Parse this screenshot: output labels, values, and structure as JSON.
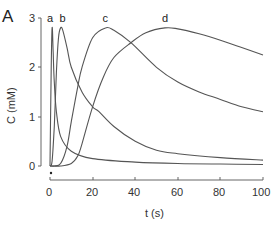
{
  "panel_label": "A",
  "chart_data": {
    "type": "line",
    "title": "",
    "xlabel": "t (s)",
    "ylabel": "C (mM)",
    "xlim": [
      0,
      100
    ],
    "ylim": [
      0,
      3
    ],
    "xticks": [
      0,
      20,
      40,
      60,
      80,
      100
    ],
    "yticks": [
      0,
      1,
      2,
      3
    ],
    "grid": false,
    "legend": "inline curve labels at peaks",
    "series": [
      {
        "name": "a",
        "x": [
          0,
          0.5,
          1,
          1.5,
          2,
          3,
          5,
          10,
          20,
          40,
          60,
          80,
          100
        ],
        "values": [
          0,
          1.8,
          2.8,
          2.3,
          1.7,
          1.1,
          0.6,
          0.3,
          0.15,
          0.08,
          0.05,
          0.04,
          0.03
        ]
      },
      {
        "name": "b",
        "x": [
          0,
          1,
          2,
          3,
          4,
          5,
          6,
          8,
          10,
          15,
          20,
          23,
          30,
          40,
          50,
          60,
          80,
          100
        ],
        "values": [
          0,
          0.1,
          0.8,
          1.9,
          2.6,
          2.8,
          2.75,
          2.4,
          2.0,
          1.5,
          1.2,
          1.1,
          0.8,
          0.5,
          0.32,
          0.25,
          0.17,
          0.12
        ]
      },
      {
        "name": "c",
        "x": [
          0,
          2,
          5,
          8,
          10,
          13,
          15,
          20,
          26,
          30,
          38,
          50,
          60,
          70,
          80,
          90,
          100
        ],
        "values": [
          0,
          0,
          0.05,
          0.4,
          0.9,
          1.6,
          2.0,
          2.6,
          2.8,
          2.75,
          2.5,
          2.0,
          1.7,
          1.5,
          1.35,
          1.2,
          1.1
        ]
      },
      {
        "name": "d",
        "x": [
          0,
          5,
          10,
          13,
          15,
          20,
          25,
          30,
          38,
          45,
          54,
          60,
          70,
          80,
          90,
          100
        ],
        "values": [
          0,
          0,
          0.05,
          0.2,
          0.45,
          1.2,
          1.8,
          2.2,
          2.5,
          2.7,
          2.8,
          2.78,
          2.68,
          2.55,
          2.4,
          2.25
        ]
      }
    ],
    "annotations": [
      {
        "text": "a",
        "x": 1,
        "y": 3
      },
      {
        "text": "b",
        "x": 5,
        "y": 3
      },
      {
        "text": "c",
        "x": 26,
        "y": 3
      },
      {
        "text": "d",
        "x": 54,
        "y": 3
      }
    ]
  }
}
